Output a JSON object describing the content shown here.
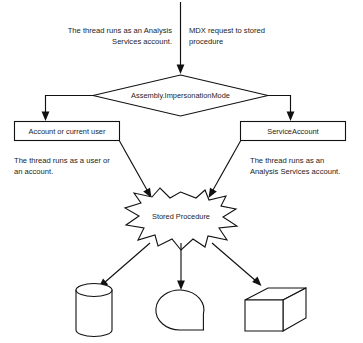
{
  "diagram": {
    "background_color": "#ffffff",
    "line_color": "#111111",
    "text_color": "#1c1c1c",
    "annotations": {
      "left_top_line1": "The thread runs as an Analysis",
      "left_top_line2": "Services account.",
      "right_top_line1": "MDX request to stored",
      "right_top_line2": "procedure",
      "left_mid_line1": "The thread runs as a user or",
      "left_mid_line2": "an account.",
      "right_mid_line1": "The thread runs as an",
      "right_mid_line2": "Analysis Services account."
    },
    "nodes": {
      "decision": "Assembly.ImpersonationMode",
      "left_box": "Account or current user",
      "right_box": "ServiceAccount",
      "star": "Stored Procedure"
    },
    "output_shapes": [
      {
        "name": "database-cylinder",
        "label": ""
      },
      {
        "name": "tape-loop",
        "label": ""
      },
      {
        "name": "olap-cube",
        "label": ""
      }
    ]
  }
}
